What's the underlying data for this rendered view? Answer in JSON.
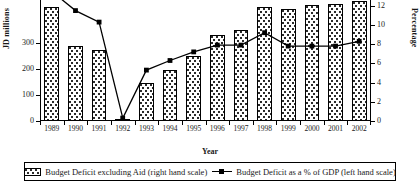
{
  "chart_data": {
    "type": "bar",
    "title": "",
    "xlabel": "Year",
    "ylabel": "JD millions",
    "ylabel_right": "Percentage",
    "categories": [
      "1989",
      "1990",
      "1991",
      "1992",
      "1993",
      "1994",
      "1995",
      "1996",
      "1997",
      "1998",
      "1999",
      "2000",
      "2001",
      "2002"
    ],
    "ylim": [
      0,
      465
    ],
    "ylim_right": [
      0,
      12.6
    ],
    "yticks": [
      0,
      100,
      200,
      300
    ],
    "yticks_right": [
      0,
      2,
      4,
      6,
      8,
      10,
      12
    ],
    "grid": false,
    "legend_position": "bottom",
    "note": "Top of plot area is cropped; tallest bars and the 1989 line point extend above the visible image.",
    "series": [
      {
        "name": "Budget Deficit excluding Aid (right hand scale)",
        "type": "bar",
        "axis": "left",
        "unit": "JD millions",
        "values": [
          440,
          287,
          272,
          5,
          145,
          195,
          250,
          330,
          350,
          440,
          430,
          445,
          450,
          460
        ]
      },
      {
        "name": "Budget Deficit as a % of GDP (left hand scale)",
        "type": "line",
        "axis": "right",
        "unit": "%",
        "marker": "square",
        "values": [
          13.5,
          11.5,
          10.3,
          0.3,
          5.3,
          6.3,
          7.2,
          7.9,
          7.9,
          9.2,
          7.8,
          7.8,
          7.8,
          8.3
        ]
      }
    ]
  },
  "legend": {
    "entries": [
      {
        "label": "Budget Deficit excluding Aid (right hand scale)",
        "swatch": "dotted-bar-swatch"
      },
      {
        "label": "Budget Deficit as a % of GDP (left hand scale)",
        "swatch": "line-marker-swatch"
      }
    ]
  }
}
